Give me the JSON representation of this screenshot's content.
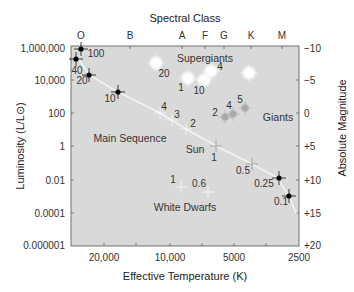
{
  "chart_data": {
    "type": "scatter",
    "top_axis": {
      "label": "Spectral Class",
      "ticks": [
        {
          "label": "O",
          "x": 81
        },
        {
          "label": "B",
          "x": 130
        },
        {
          "label": "A",
          "x": 182
        },
        {
          "label": "F",
          "x": 205
        },
        {
          "label": "G",
          "x": 224
        },
        {
          "label": "K",
          "x": 251
        },
        {
          "label": "M",
          "x": 282
        }
      ]
    },
    "xlabel": "Effective Temperature (K)",
    "xticks": [
      {
        "label": "20,000",
        "x": 104
      },
      {
        "label": "10,000",
        "x": 170
      },
      {
        "label": "5000",
        "x": 234
      },
      {
        "label": "2500",
        "x": 299
      }
    ],
    "ylabel": "Luminosity (L/L⊙)",
    "yticks": [
      {
        "label": "1,000,000",
        "y": 48
      },
      {
        "label": "10,000",
        "y": 80
      },
      {
        "label": "100",
        "y": 113
      },
      {
        "label": "1",
        "y": 146
      },
      {
        "label": "0.01",
        "y": 180
      },
      {
        "label": "0.0001",
        "y": 213
      },
      {
        "label": "0.000001",
        "y": 245
      }
    ],
    "y2label": "Absolute Magnitude",
    "y2ticks": [
      {
        "label": "−10",
        "y": 48
      },
      {
        "label": "−5",
        "y": 80
      },
      {
        "label": "0",
        "y": 113
      },
      {
        "label": "+5",
        "y": 146
      },
      {
        "label": "+10",
        "y": 180
      },
      {
        "label": "+15",
        "y": 213
      },
      {
        "label": "+20",
        "y": 245
      }
    ],
    "xscale": "log (reversed)",
    "yscale": "log",
    "ylim": [
      1e-06,
      1000000
    ],
    "y2lim": [
      -10,
      20
    ],
    "xlim": [
      40000,
      2500
    ],
    "grid": false,
    "region_labels": [
      {
        "text": "Supergiants",
        "x": 205,
        "y": 62
      },
      {
        "text": "Main Sequence",
        "x": 130,
        "y": 142
      },
      {
        "text": "Giants",
        "x": 278,
        "y": 121
      },
      {
        "text": "Sun",
        "x": 195,
        "y": 153
      },
      {
        "text": "White Dwarfs",
        "x": 185,
        "y": 211
      }
    ],
    "series": [
      {
        "name": "Main Sequence",
        "marker": "cross",
        "points": [
          {
            "mass_label": "100",
            "x": 81,
            "y": 49,
            "label_x": 96,
            "label_y": 57,
            "style": "dark"
          },
          {
            "mass_label": "40",
            "x": 76,
            "y": 59,
            "label_x": 77,
            "label_y": 74,
            "style": "dark"
          },
          {
            "mass_label": "20",
            "x": 89,
            "y": 75,
            "label_x": 82,
            "label_y": 84,
            "style": "dark"
          },
          {
            "mass_label": "10",
            "x": 118,
            "y": 92,
            "label_x": 110,
            "label_y": 102,
            "style": "dark"
          },
          {
            "mass_label": "4",
            "x": 160,
            "y": 113,
            "label_x": 164,
            "label_y": 110,
            "style": "light"
          },
          {
            "mass_label": "3",
            "x": 172,
            "y": 120,
            "label_x": 177,
            "label_y": 118,
            "style": "light"
          },
          {
            "mass_label": "2",
            "x": 186,
            "y": 129,
            "label_x": 193,
            "label_y": 127,
            "style": "light"
          },
          {
            "mass_label": "1",
            "x": 216,
            "y": 146,
            "label_x": 214,
            "label_y": 161,
            "style": "grey"
          },
          {
            "mass_label": "0.5",
            "x": 252,
            "y": 164,
            "label_x": 243,
            "label_y": 174,
            "style": "grey"
          },
          {
            "mass_label": "0.25",
            "x": 279,
            "y": 178,
            "label_x": 264,
            "label_y": 187,
            "style": "dark"
          },
          {
            "mass_label": "0.1",
            "x": 289,
            "y": 196,
            "label_x": 281,
            "label_y": 205,
            "style": "dark"
          }
        ]
      },
      {
        "name": "Supergiants",
        "marker": "glow",
        "points": [
          {
            "mass_label": "20",
            "x": 156,
            "y": 63,
            "label_x": 164,
            "label_y": 77
          },
          {
            "mass_label": "1",
            "x": 188,
            "y": 78,
            "label_x": 181,
            "label_y": 91
          },
          {
            "mass_label": "10",
            "x": 204,
            "y": 80,
            "label_x": 199,
            "label_y": 94
          },
          {
            "mass_label": "4",
            "x": 211,
            "y": 71,
            "label_x": 220,
            "label_y": 70
          },
          {
            "mass_label": "",
            "x": 249,
            "y": 73,
            "label_x": 0,
            "label_y": 0
          }
        ]
      },
      {
        "name": "Giants",
        "marker": "grey-dot",
        "points": [
          {
            "mass_label": "2",
            "x": 225,
            "y": 117,
            "label_x": 215,
            "label_y": 116
          },
          {
            "mass_label": "4",
            "x": 233,
            "y": 114,
            "label_x": 229,
            "label_y": 109
          },
          {
            "mass_label": "5",
            "x": 245,
            "y": 108,
            "label_x": 240,
            "label_y": 103
          }
        ]
      },
      {
        "name": "White Dwarfs",
        "marker": "cross-light",
        "points": [
          {
            "mass_label": "1",
            "x": 181,
            "y": 187,
            "label_x": 173,
            "label_y": 183
          },
          {
            "mass_label": "0.6",
            "x": 208,
            "y": 192,
            "label_x": 199,
            "label_y": 187
          }
        ]
      }
    ],
    "main_sequence_curve": "M78,58 L89,75 L118,92 L160,113 L186,129 L216,146 L252,164 L276,177 L289,196 L296,213"
  }
}
